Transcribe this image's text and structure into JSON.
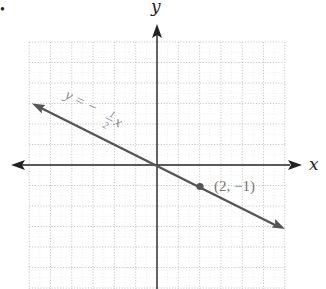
{
  "chart_data": {
    "type": "line",
    "title": "",
    "xlabel": "x",
    "ylabel": "y",
    "xlim": [
      -6,
      6
    ],
    "ylim": [
      -6,
      6
    ],
    "grid": true,
    "series": [
      {
        "name": "y = -1/2 x",
        "equation": "y = -½ x",
        "slope": -0.5,
        "intercept": 0,
        "x": [
          -5.8,
          0,
          2,
          6
        ],
        "y": [
          2.9,
          0,
          -1,
          -3
        ],
        "arrows": "both",
        "color": "#555555"
      }
    ],
    "points": [
      {
        "x": 2,
        "y": -1,
        "label": "(2, −1)"
      }
    ],
    "annotations": [
      {
        "text": "y = −½ x",
        "position": "along line, upper left"
      }
    ]
  },
  "labels": {
    "x_axis": "x",
    "y_axis": "y",
    "eq_left": "y = −",
    "eq_num": "1",
    "eq_den": "2",
    "eq_var": "x",
    "point": "(2, −1)",
    "bullet": "•"
  },
  "colors": {
    "axis": "#222222",
    "line": "#555555",
    "grid": "#bbbbbb",
    "label": "#888888"
  }
}
